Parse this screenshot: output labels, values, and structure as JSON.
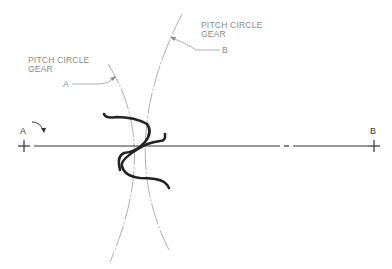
{
  "diagram": {
    "type": "gear-mesh-pitch-circles",
    "labels": {
      "gear_a_callout_line1": "PITCH CIRCLE",
      "gear_a_callout_line2": "GEAR",
      "gear_a_callout_id": "A",
      "gear_b_callout_line1": "PITCH CIRCLE",
      "gear_b_callout_line2": "GEAR",
      "gear_b_callout_id": "B",
      "center_a": "A",
      "center_b": "B"
    },
    "colors": {
      "background": "#ffffff",
      "center_line": "#333333",
      "tooth_profile": "#222222",
      "pitch_circle": "#999999",
      "label_text": "#8a8a8a"
    }
  }
}
